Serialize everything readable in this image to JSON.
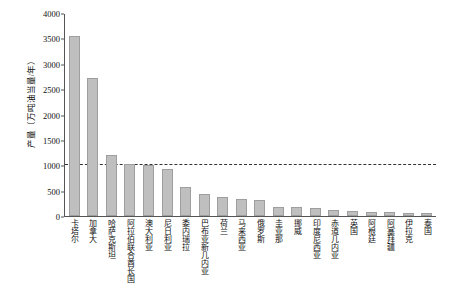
{
  "chart_data": {
    "type": "bar",
    "title": "",
    "xlabel": "",
    "ylabel": "产量（万吨油当量/年）",
    "ylim": [
      0,
      4000
    ],
    "yticks": [
      0,
      500,
      1000,
      1500,
      2000,
      2500,
      3000,
      3500,
      4000
    ],
    "grid": false,
    "legend": "none",
    "categories": [
      "卡塔尔",
      "加拿大",
      "哈萨克斯坦",
      "阿拉伯联合酋长国",
      "澳大利亚",
      "尼日利亚",
      "委内瑞拉",
      "巴布亚新几内亚",
      "荷兰",
      "马来西亚",
      "俄罗斯",
      "圭亚那",
      "挪威",
      "印度尼西亚",
      "赤道几内亚",
      "英国",
      "阿根廷",
      "阿塞拜疆",
      "伊拉克",
      "泰国"
    ],
    "values": [
      3540,
      2720,
      1210,
      1020,
      1000,
      930,
      580,
      430,
      380,
      330,
      320,
      175,
      170,
      150,
      110,
      95,
      80,
      70,
      60,
      50
    ],
    "annotations": [
      {
        "type": "threshold-line",
        "style": "dashed",
        "value": 1000
      }
    ]
  }
}
